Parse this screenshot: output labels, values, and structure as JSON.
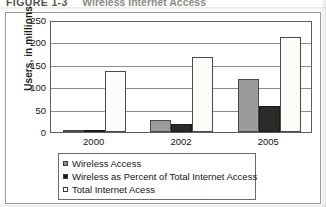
{
  "caption": {
    "label": "FIGURE 1-3",
    "title": "Wireless Internet Access"
  },
  "chart_data": {
    "type": "bar",
    "title": "Wireless Internet Access",
    "xlabel": "",
    "ylabel": "Users, in millions",
    "ylim": [
      0,
      250
    ],
    "yticks": [
      0,
      50,
      100,
      150,
      200,
      250
    ],
    "grid": true,
    "legend_position": "bottom",
    "categories": [
      "2000",
      "2002",
      "2005"
    ],
    "series": [
      {
        "name": "Wireless Access",
        "color": "#9b9b99",
        "values": [
          3,
          27,
          118
        ]
      },
      {
        "name": "Wireless as Percent of Total Internet Access",
        "color": "#2a2a28",
        "values": [
          2,
          17,
          58
        ]
      },
      {
        "name": "Total Internet Acess",
        "color": "#fbfbf8",
        "values": [
          136,
          167,
          212
        ]
      }
    ]
  }
}
